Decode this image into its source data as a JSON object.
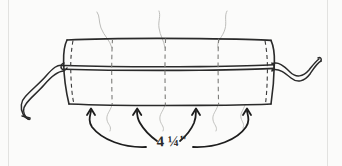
{
  "figure": {
    "type": "line-sketch",
    "background_color": "#fbfbfa",
    "ink_color": "#2a2a2a",
    "faint_ink_color": "#b9b9b7",
    "border_color": "#e2e2e0"
  },
  "annotations": {
    "measurement": "4 ¼\"",
    "measurement_value": 4.25,
    "measurement_unit": "inch",
    "arrow_count": 4,
    "arrow_description": "four curved arrows pointing up from the measurement label to the lower edge of the bolster"
  },
  "bolster": {
    "label": "bolster-body",
    "dashed_gather_lines": 3,
    "dashed_end_seam_lines": 2,
    "horizontal_seam_lines": 1,
    "end_ties": [
      {
        "side": "left",
        "label": "left-ribbon-tie"
      },
      {
        "side": "right",
        "label": "right-ribbon-tie"
      }
    ],
    "thread_lines_top": 3,
    "thread_lines_bottom": 4
  },
  "geometry": {
    "body_left": 66,
    "body_right": 272,
    "body_top": 38,
    "body_bottom": 105,
    "mid_seam_y": 66,
    "dash_x": [
      113,
      166,
      219
    ]
  }
}
